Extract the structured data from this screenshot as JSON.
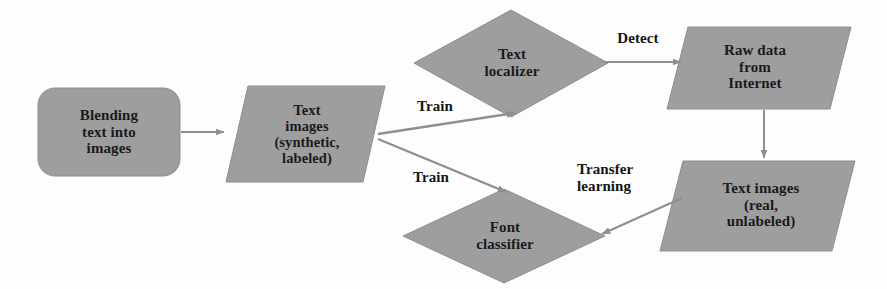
{
  "diagram": {
    "type": "flowchart",
    "canvas": {
      "width": 887,
      "height": 289
    },
    "colors": {
      "shape_fill": "#9e9e9e",
      "shape_stroke": "#8c8c8c",
      "arrow": "#8f8f8f",
      "text": "#1a1a1a",
      "background": "#fdfdfd"
    },
    "nodes": [
      {
        "id": "blending",
        "shape": "rounded-rectangle",
        "label": "Blending\ntext into\nimages"
      },
      {
        "id": "synthetic",
        "shape": "parallelogram",
        "label": "Text\nimages\n(synthetic,\nlabeled)"
      },
      {
        "id": "text-localizer",
        "shape": "diamond",
        "label": "Text\nlocalizer"
      },
      {
        "id": "font-classifier",
        "shape": "diamond",
        "label": "Font\nclassifier"
      },
      {
        "id": "raw-data",
        "shape": "parallelogram",
        "label": "Raw data\nfrom\nInternet"
      },
      {
        "id": "real-images",
        "shape": "parallelogram",
        "label": "Text images\n(real,\nunlabeled)"
      }
    ],
    "edges": [
      {
        "id": "e1",
        "from": "blending",
        "to": "synthetic",
        "label": ""
      },
      {
        "id": "e2",
        "from": "synthetic",
        "to": "text-localizer",
        "label": "Train"
      },
      {
        "id": "e3",
        "from": "synthetic",
        "to": "font-classifier",
        "label": "Train"
      },
      {
        "id": "e4",
        "from": "text-localizer",
        "to": "raw-data",
        "label": "Detect"
      },
      {
        "id": "e5",
        "from": "raw-data",
        "to": "real-images",
        "label": ""
      },
      {
        "id": "e6",
        "from": "real-images",
        "to": "font-classifier",
        "label": "Transfer\nlearning"
      }
    ]
  }
}
